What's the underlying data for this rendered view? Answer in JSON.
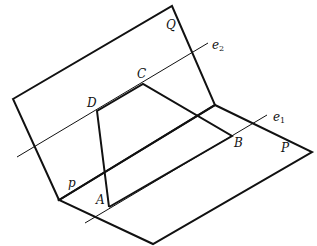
{
  "diagram": {
    "type": "dihedral-angle-figure",
    "planes": [
      {
        "name": "Q",
        "label": "Q",
        "points": [
          [
            13,
            99
          ],
          [
            172,
            6
          ],
          [
            215,
            105
          ],
          [
            59,
            200
          ]
        ]
      },
      {
        "name": "P",
        "label": "P",
        "points": [
          [
            59,
            200
          ],
          [
            215,
            105
          ],
          [
            312,
            152
          ],
          [
            153,
            244
          ]
        ]
      }
    ],
    "fold_edge": {
      "from": [
        59,
        200
      ],
      "to": [
        215,
        105
      ]
    },
    "quadrilateral": {
      "vertices": {
        "A": [
          109,
          207
        ],
        "B": [
          232,
          136
        ],
        "C": [
          143,
          84
        ],
        "D": [
          97,
          111
        ]
      },
      "edges": [
        [
          "D",
          "C"
        ],
        [
          "C",
          "B"
        ],
        [
          "B",
          "A"
        ],
        [
          "A",
          "D"
        ]
      ]
    },
    "lines": [
      {
        "name": "e2",
        "base": "e",
        "sub": "2",
        "from": [
          17,
          157
        ],
        "to": [
          208,
          43
        ]
      },
      {
        "name": "e1",
        "base": "e",
        "sub": "1",
        "from": [
          85,
          223
        ],
        "to": [
          267,
          115
        ]
      }
    ],
    "labels": {
      "Q": "Q",
      "P": "P",
      "p": "p",
      "A": "A",
      "B": "B",
      "C": "C",
      "D": "D",
      "e1_base": "e",
      "e1_sub": "1",
      "e2_base": "e",
      "e2_sub": "2"
    },
    "colors": {
      "stroke": "#111111",
      "background": "#ffffff"
    }
  }
}
